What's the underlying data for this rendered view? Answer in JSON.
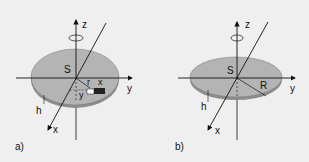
{
  "panels": [
    {
      "id": "a",
      "caption": "a)",
      "labels": {
        "z": "z",
        "y": "y",
        "x": "x",
        "center": "S",
        "radius": "r",
        "element_x": "x",
        "element_y": "y",
        "thickness": "h"
      },
      "shape": "elliptical plate with volume element"
    },
    {
      "id": "b",
      "caption": "b)",
      "labels": {
        "z": "z",
        "y": "y",
        "x": "x",
        "center": "S",
        "radius": "R",
        "thickness": "h"
      },
      "shape": "circular disk"
    }
  ],
  "colors": {
    "background": "#efefef",
    "disk_fill": "#b4b4b4",
    "disk_edge": "#8c8c8c",
    "line": "#111111",
    "element_dark": "#222222"
  }
}
